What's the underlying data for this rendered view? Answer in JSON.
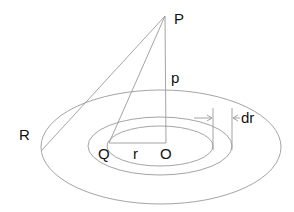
{
  "diagram": {
    "labels": {
      "P": "P",
      "p": "p",
      "R": "R",
      "Q": "Q",
      "r": "r",
      "O": "O",
      "dr": "dr"
    },
    "colors": {
      "line": "#9a9a9a",
      "text": "#111111",
      "background": "#ffffff"
    }
  }
}
